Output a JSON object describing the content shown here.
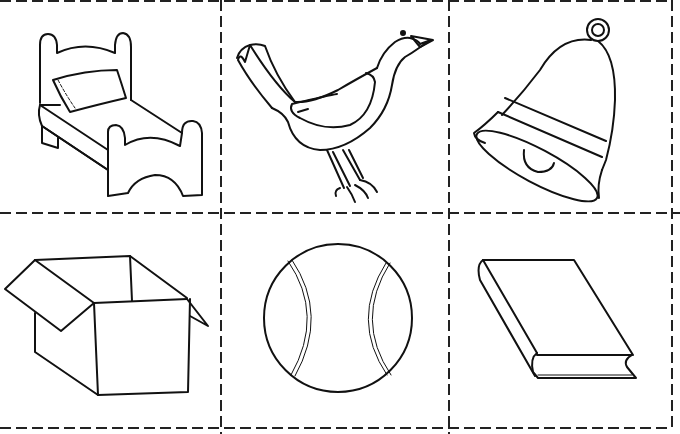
{
  "sheet": {
    "layout": {
      "columns": 3,
      "rows": 2
    },
    "line_color": "#111111",
    "background": "#ffffff",
    "cut_lines": "dashed"
  },
  "cards": [
    {
      "row": 1,
      "col": 1,
      "item": "bed",
      "icon": "bed-icon"
    },
    {
      "row": 1,
      "col": 2,
      "item": "bird",
      "icon": "bird-icon"
    },
    {
      "row": 1,
      "col": 3,
      "item": "bell",
      "icon": "bell-icon"
    },
    {
      "row": 2,
      "col": 1,
      "item": "box",
      "icon": "box-icon"
    },
    {
      "row": 2,
      "col": 2,
      "item": "ball",
      "icon": "ball-icon"
    },
    {
      "row": 2,
      "col": 3,
      "item": "book",
      "icon": "book-icon"
    }
  ]
}
